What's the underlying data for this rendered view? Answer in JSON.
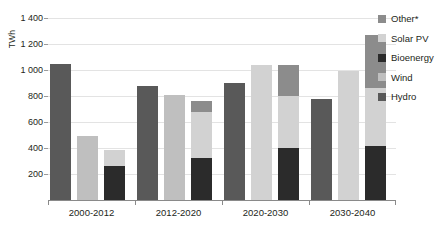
{
  "title_remnant": "",
  "axis": {
    "ylabel": "TWh",
    "yticks": [
      "200",
      "400",
      "600",
      "800",
      "1 000",
      "1 200",
      "1 400"
    ],
    "xticklabels": [
      "2000-2012",
      "2012-2020",
      "2020-2030",
      "2030-2040"
    ]
  },
  "legend": {
    "items": [
      {
        "label": "Other*",
        "color": "#8c8c8c"
      },
      {
        "label": "Solar PV",
        "color": "#d2d2d2"
      },
      {
        "label": "Bioenergy",
        "color": "#2b2b2b"
      },
      {
        "label": "Wind",
        "color": "#bfbfbf"
      },
      {
        "label": "Hydro",
        "color": "#595959"
      }
    ]
  },
  "chart_data": {
    "type": "bar",
    "subtype": "grouped-stacked",
    "title": "",
    "xlabel": "",
    "ylabel": "TWh",
    "ylim": [
      0,
      1400
    ],
    "ytick_step": 200,
    "grid": true,
    "legend_position": "right",
    "categories": [
      "2000-2012",
      "2012-2020",
      "2020-2030",
      "2030-2040"
    ],
    "series": [
      {
        "name": "Hydro",
        "color": "#595959"
      },
      {
        "name": "Wind",
        "color": "#bfbfbf"
      },
      {
        "name": "Bioenergy",
        "color": "#2b2b2b"
      },
      {
        "name": "Solar PV",
        "color": "#d2d2d2"
      },
      {
        "name": "Other*",
        "color": "#8c8c8c"
      }
    ],
    "groups": [
      {
        "category": "2000-2012",
        "bars": [
          {
            "total": 1050,
            "segments": [
              {
                "series": "Hydro",
                "value": 1050
              }
            ]
          },
          {
            "total": 490,
            "segments": [
              {
                "series": "Wind",
                "value": 490
              }
            ]
          },
          {
            "total": 385,
            "segments": [
              {
                "series": "Bioenergy",
                "value": 265
              },
              {
                "series": "Solar PV",
                "value": 120
              }
            ]
          }
        ]
      },
      {
        "category": "2012-2020",
        "bars": [
          {
            "total": 880,
            "segments": [
              {
                "series": "Hydro",
                "value": 880
              }
            ]
          },
          {
            "total": 810,
            "segments": [
              {
                "series": "Wind",
                "value": 810
              }
            ]
          },
          {
            "total": 760,
            "segments": [
              {
                "series": "Bioenergy",
                "value": 320
              },
              {
                "series": "Solar PV",
                "value": 360
              },
              {
                "series": "Other*",
                "value": 80
              }
            ]
          }
        ]
      },
      {
        "category": "2020-2030",
        "bars": [
          {
            "total": 900,
            "segments": [
              {
                "series": "Hydro",
                "value": 900
              }
            ]
          },
          {
            "total": 1035,
            "segments": [
              {
                "series": "Solar PV",
                "value": 1035
              }
            ]
          },
          {
            "total": 1035,
            "segments": [
              {
                "series": "Bioenergy",
                "value": 400
              },
              {
                "series": "Solar PV",
                "value": 400
              },
              {
                "series": "Other*",
                "value": 235
              }
            ]
          }
        ]
      },
      {
        "category": "2030-2040",
        "bars": [
          {
            "total": 780,
            "segments": [
              {
                "series": "Hydro",
                "value": 780
              }
            ]
          },
          {
            "total": 995,
            "segments": [
              {
                "series": "Solar PV",
                "value": 995
              }
            ]
          },
          {
            "total": 1270,
            "segments": [
              {
                "series": "Bioenergy",
                "value": 415
              },
              {
                "series": "Solar PV",
                "value": 445
              },
              {
                "series": "Other*",
                "value": 410
              }
            ]
          }
        ]
      }
    ]
  }
}
